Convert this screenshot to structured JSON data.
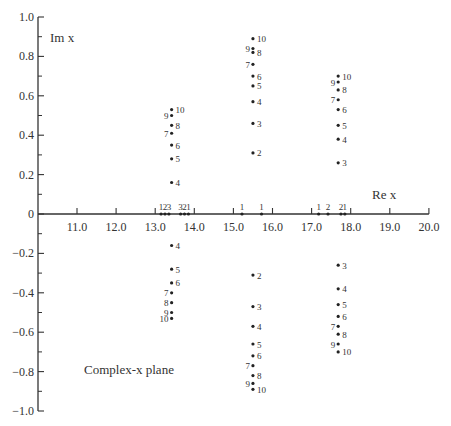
{
  "chart_data": {
    "type": "scatter",
    "title": "",
    "xlabel": "Re x",
    "ylabel": "Im x",
    "annotation": "Complex-x plane",
    "xlim": [
      10.0,
      20.0
    ],
    "ylim": [
      -1.0,
      1.0
    ],
    "x_ticks": [
      "11.0",
      "12.0",
      "13.0",
      "14.0",
      "15.0",
      "16.0",
      "17.0",
      "18.0",
      "19.0",
      "20.0"
    ],
    "x_tick_values": [
      11,
      12,
      13,
      14,
      15,
      16,
      17,
      18,
      19,
      20
    ],
    "y_ticks": [
      "1.0",
      "0.8",
      "0.6",
      "0.4",
      "0.2",
      "0",
      "-0.2",
      "-0.4",
      "-0.6",
      "-0.8",
      "-1.0"
    ],
    "y_tick_values": [
      1.0,
      0.8,
      0.6,
      0.4,
      0.2,
      0,
      -0.2,
      -0.4,
      -0.6,
      -0.8,
      -1.0
    ],
    "grid": false,
    "legend": null,
    "series": [
      {
        "name": "Left cluster (Re ≈ 13.4)",
        "points": [
          {
            "label": "4",
            "re": 13.42,
            "im": 0.16
          },
          {
            "label": "5",
            "re": 13.42,
            "im": 0.28
          },
          {
            "label": "6",
            "re": 13.42,
            "im": 0.35
          },
          {
            "label": "7",
            "re": 13.42,
            "im": 0.41
          },
          {
            "label": "8",
            "re": 13.42,
            "im": 0.45
          },
          {
            "label": "9",
            "re": 13.42,
            "im": 0.5
          },
          {
            "label": "10",
            "re": 13.42,
            "im": 0.53
          },
          {
            "label": "4",
            "re": 13.42,
            "im": -0.16
          },
          {
            "label": "5",
            "re": 13.42,
            "im": -0.28
          },
          {
            "label": "6",
            "re": 13.42,
            "im": -0.35
          },
          {
            "label": "7",
            "re": 13.42,
            "im": -0.4
          },
          {
            "label": "8",
            "re": 13.42,
            "im": -0.45
          },
          {
            "label": "9",
            "re": 13.42,
            "im": -0.5
          },
          {
            "label": "10",
            "re": 13.42,
            "im": -0.53
          }
        ]
      },
      {
        "name": "Middle cluster (Re ≈ 15.5)",
        "points": [
          {
            "label": "2",
            "re": 15.5,
            "im": 0.31
          },
          {
            "label": "3",
            "re": 15.5,
            "im": 0.46
          },
          {
            "label": "4",
            "re": 15.5,
            "im": 0.57
          },
          {
            "label": "5",
            "re": 15.5,
            "im": 0.65
          },
          {
            "label": "6",
            "re": 15.5,
            "im": 0.7
          },
          {
            "label": "7",
            "re": 15.5,
            "im": 0.76
          },
          {
            "label": "8",
            "re": 15.5,
            "im": 0.82
          },
          {
            "label": "9",
            "re": 15.5,
            "im": 0.84
          },
          {
            "label": "10",
            "re": 15.5,
            "im": 0.89
          },
          {
            "label": "2",
            "re": 15.5,
            "im": -0.31
          },
          {
            "label": "3",
            "re": 15.5,
            "im": -0.47
          },
          {
            "label": "4",
            "re": 15.5,
            "im": -0.57
          },
          {
            "label": "5",
            "re": 15.5,
            "im": -0.66
          },
          {
            "label": "6",
            "re": 15.5,
            "im": -0.72
          },
          {
            "label": "7",
            "re": 15.5,
            "im": -0.77
          },
          {
            "label": "8",
            "re": 15.5,
            "im": -0.82
          },
          {
            "label": "9",
            "re": 15.5,
            "im": -0.86
          },
          {
            "label": "10",
            "re": 15.5,
            "im": -0.89
          }
        ]
      },
      {
        "name": "Right cluster (Re ≈ 17.7)",
        "points": [
          {
            "label": "3",
            "re": 17.68,
            "im": 0.26
          },
          {
            "label": "4",
            "re": 17.68,
            "im": 0.38
          },
          {
            "label": "5",
            "re": 17.68,
            "im": 0.45
          },
          {
            "label": "6",
            "re": 17.68,
            "im": 0.53
          },
          {
            "label": "7",
            "re": 17.68,
            "im": 0.58
          },
          {
            "label": "8",
            "re": 17.68,
            "im": 0.63
          },
          {
            "label": "9",
            "re": 17.68,
            "im": 0.67
          },
          {
            "label": "10",
            "re": 17.68,
            "im": 0.7
          },
          {
            "label": "3",
            "re": 17.68,
            "im": -0.26
          },
          {
            "label": "4",
            "re": 17.68,
            "im": -0.38
          },
          {
            "label": "5",
            "re": 17.68,
            "im": -0.46
          },
          {
            "label": "6",
            "re": 17.68,
            "im": -0.52
          },
          {
            "label": "7",
            "re": 17.68,
            "im": -0.57
          },
          {
            "label": "8",
            "re": 17.68,
            "im": -0.61
          },
          {
            "label": "9",
            "re": 17.68,
            "im": -0.66
          },
          {
            "label": "10",
            "re": 17.68,
            "im": -0.7
          }
        ]
      },
      {
        "name": "Real-axis points",
        "points": [
          {
            "label": "1",
            "re": 13.15,
            "im": 0
          },
          {
            "label": "2",
            "re": 13.25,
            "im": 0
          },
          {
            "label": "3",
            "re": 13.35,
            "im": 0
          },
          {
            "label": "3",
            "re": 13.65,
            "im": 0
          },
          {
            "label": "2",
            "re": 13.75,
            "im": 0
          },
          {
            "label": "1",
            "re": 13.85,
            "im": 0
          },
          {
            "label": "1",
            "re": 15.22,
            "im": 0
          },
          {
            "label": "1",
            "re": 15.72,
            "im": 0
          },
          {
            "label": "1",
            "re": 17.18,
            "im": 0
          },
          {
            "label": "2",
            "re": 17.42,
            "im": 0
          },
          {
            "label": "2",
            "re": 17.75,
            "im": 0
          },
          {
            "label": "1",
            "re": 17.85,
            "im": 0
          }
        ]
      }
    ]
  }
}
